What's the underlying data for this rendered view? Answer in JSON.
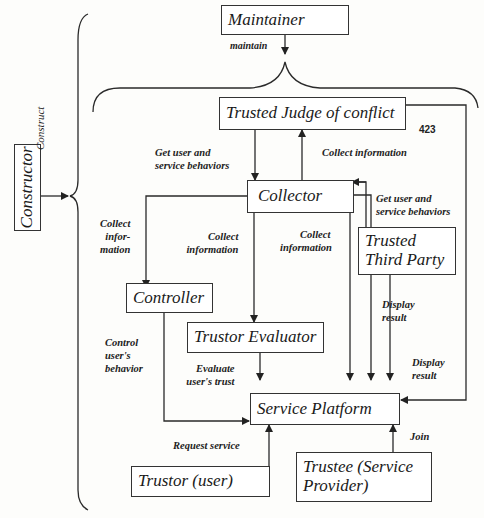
{
  "diagram": {
    "page_number": "423",
    "nodes": {
      "maintainer": "Maintainer",
      "constructor": "Constructor",
      "trusted_judge": "Trusted Judge of conflict",
      "collector": "Collector",
      "trusted_third_party_line1": "Trusted",
      "trusted_third_party_line2": "Third Party",
      "controller": "Controller",
      "trustor_evaluator": "Trustor Evaluator",
      "service_platform": "Service Platform",
      "trustor": "Trustor (user)",
      "trustee_line1": "Trustee (Service",
      "trustee_line2": "Provider)"
    },
    "edges": {
      "maintain": "maintain",
      "construct": "Construct",
      "get_behaviors_left_1": "Get user and",
      "get_behaviors_left_2": "service behaviors",
      "collect_info_judge": "Collect information",
      "get_behaviors_right_1": "Get user and",
      "get_behaviors_right_2": "service behaviors",
      "collect_infor_1": "Collect",
      "collect_infor_2": "infor-",
      "collect_infor_3": "mation",
      "collect_info_eval_1": "Collect",
      "collect_info_eval_2": "information",
      "collect_info_platform_1": "Collect",
      "collect_info_platform_2": "information",
      "display_result_ttp_1": "Display",
      "display_result_ttp_2": "result",
      "display_result_judge_1": "Display",
      "display_result_judge_2": "result",
      "control_1": "Control",
      "control_2": "user's",
      "control_3": "behavior",
      "evaluate_1": "Evaluate",
      "evaluate_2": "user's trust",
      "request_service": "Request service",
      "join": "Join"
    }
  }
}
